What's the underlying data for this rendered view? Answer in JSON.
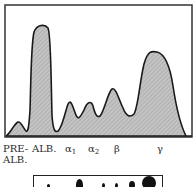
{
  "figure": {
    "title": "",
    "fractions": [
      {
        "id": "prealbumin",
        "label_line1": "PRE-",
        "label_line2": "ALB.",
        "peak_height_rel": 0.12
      },
      {
        "id": "albumin",
        "label": "ALB.",
        "peak_height_rel": 1.0
      },
      {
        "id": "alpha1",
        "label_base": "α",
        "label_sub": "1",
        "peak_height_rel": 0.27
      },
      {
        "id": "alpha2",
        "label_base": "α",
        "label_sub": "2",
        "peak_height_rel": 0.28
      },
      {
        "id": "beta",
        "label": "β",
        "peak_height_rel": 0.44
      },
      {
        "id": "gamma",
        "label": "γ",
        "peak_height_rel": 0.77
      }
    ],
    "colors": {
      "fill": "#b8b8b8",
      "outline": "#1a1a1a",
      "frame": "#333333"
    }
  }
}
